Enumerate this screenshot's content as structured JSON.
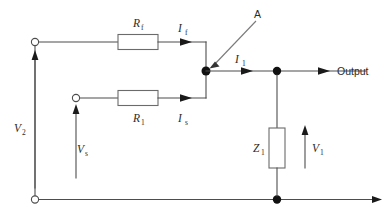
{
  "diagram": {
    "background_color": "#ffffff",
    "wire_color": "#4d4d4d",
    "node_color": "#111111",
    "components": {
      "resistor_feedback": {
        "symbol": "R",
        "subscript": "f",
        "name": "feedback-resistor"
      },
      "resistor_source": {
        "symbol": "R",
        "subscript": "1",
        "name": "source-resistor"
      },
      "impedance_load": {
        "symbol": "Z",
        "subscript": "1",
        "name": "load-impedance"
      }
    },
    "currents": {
      "feedback": {
        "symbol": "I",
        "subscript": "f"
      },
      "source": {
        "symbol": "I",
        "subscript": "s"
      },
      "load": {
        "symbol": "I",
        "subscript": "1"
      }
    },
    "voltages": {
      "output_rail": {
        "symbol": "V",
        "subscript": "2"
      },
      "source": {
        "symbol": "V",
        "subscript": "s"
      },
      "load": {
        "symbol": "V",
        "subscript": "1"
      }
    },
    "annotations": {
      "node_a": "A",
      "output": "Output"
    },
    "terminals": [
      {
        "name": "terminal-v2-top",
        "type": "open-circle"
      },
      {
        "name": "terminal-vs",
        "type": "open-circle"
      },
      {
        "name": "terminal-v2-bottom",
        "type": "open-circle"
      }
    ],
    "junctions": [
      {
        "name": "node-a",
        "type": "filled-dot"
      },
      {
        "name": "node-output-top",
        "type": "filled-dot"
      },
      {
        "name": "node-output-bottom",
        "type": "filled-dot"
      }
    ]
  }
}
